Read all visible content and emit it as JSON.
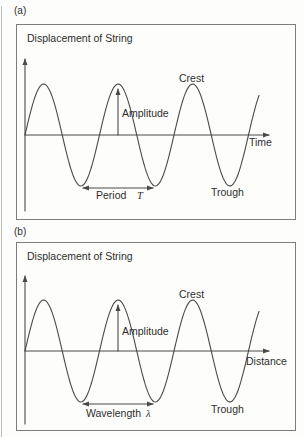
{
  "figure": {
    "panels": [
      {
        "panel_label": "(a)",
        "axis_title": "Displacement of String",
        "x_axis_label": "Time",
        "crest_label": "Crest",
        "trough_label": "Trough",
        "amplitude_label": "Amplitude",
        "span_label": "Period",
        "span_symbol": "T"
      },
      {
        "panel_label": "(b)",
        "axis_title": "Displacement of String",
        "x_axis_label": "Distance",
        "crest_label": "Crest",
        "trough_label": "Trough",
        "amplitude_label": "Amplitude",
        "span_label": "Wavelength",
        "span_symbol": "λ"
      }
    ],
    "colors": {
      "line": "#4a4a4a",
      "text": "#2e2e2e",
      "background": "#fdfdfb"
    }
  }
}
